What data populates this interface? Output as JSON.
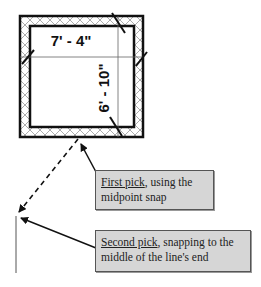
{
  "diagram": {
    "dimensions": {
      "horizontal": "7' - 4\"",
      "vertical": "6' - 10\""
    },
    "callouts": [
      {
        "emphasis": "First pick",
        "rest": ", using the midpoint snap"
      },
      {
        "emphasis": "Second pick",
        "rest": ", snapping to the middle of the line's end"
      }
    ],
    "colors": {
      "line": "#111111",
      "callout_bg": "#d6d6d6",
      "callout_border": "#555555"
    }
  }
}
